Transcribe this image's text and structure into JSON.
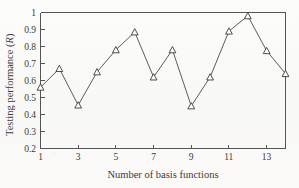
{
  "chart_data": {
    "type": "line",
    "title": "",
    "xlabel": "Number of basis functions",
    "ylabel": "Testing performance (R)",
    "ylabel_parts": {
      "main": "Testing performance (",
      "italic": "R",
      "close": ")"
    },
    "x": [
      1,
      2,
      3,
      4,
      5,
      6,
      7,
      8,
      9,
      10,
      11,
      12,
      13,
      14
    ],
    "values": [
      0.56,
      0.67,
      0.455,
      0.65,
      0.78,
      0.885,
      0.62,
      0.78,
      0.45,
      0.62,
      0.89,
      0.98,
      0.775,
      0.64
    ],
    "series": [
      {
        "name": "Testing performance",
        "values": [
          0.56,
          0.67,
          0.455,
          0.65,
          0.78,
          0.885,
          0.62,
          0.78,
          0.45,
          0.62,
          0.89,
          0.98,
          0.775,
          0.64
        ],
        "marker": "open-triangle",
        "line_color": "#4a4a4a",
        "marker_color": "#3d3d3d"
      }
    ],
    "xlim": [
      1,
      14
    ],
    "ylim": [
      0.2,
      1.0
    ],
    "xticks": [
      1,
      3,
      5,
      7,
      9,
      11,
      13
    ],
    "xtick_labels": [
      "1",
      "3",
      "5",
      "7",
      "9",
      "11",
      "13"
    ],
    "yticks": [
      0.2,
      0.3,
      0.4,
      0.5,
      0.6,
      0.7,
      0.8,
      0.9,
      1.0
    ],
    "ytick_labels": [
      "0.2",
      "0.3",
      "0.4",
      "0.5",
      "0.6",
      "0.7",
      "0.8",
      "0.9",
      "1"
    ],
    "grid": false,
    "legend": null,
    "legend_position": "none",
    "background_color": "#fbfbfa",
    "axis_color": "#555555"
  }
}
